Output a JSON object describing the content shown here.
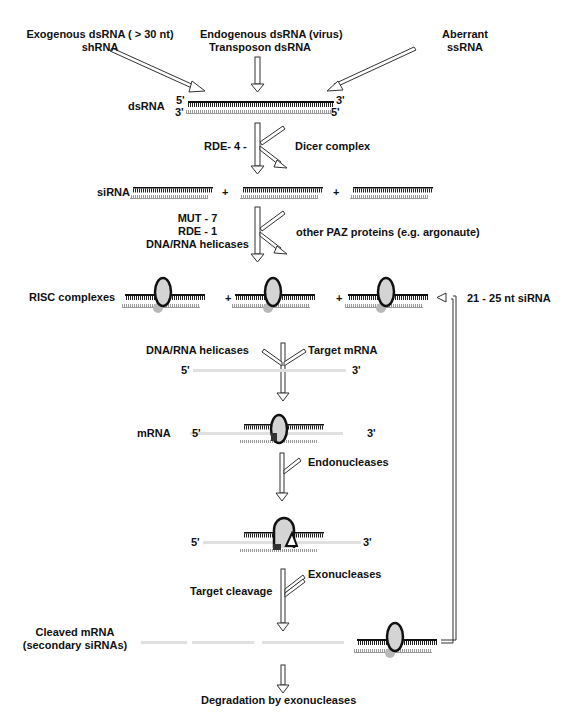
{
  "sources": {
    "left": [
      "Exogenous dsRNA ( > 30 nt)",
      "shRNA"
    ],
    "center": [
      "Endogenous dsRNA (virus)",
      "Transposon dsRNA"
    ],
    "right": [
      "Aberrant",
      "ssRNA"
    ]
  },
  "labels": {
    "dsrna": "dsRNA",
    "sirna": "siRNA",
    "risc": "RISC complexes",
    "mrna": "mRNA",
    "cleaved_1": "Cleaved mRNA",
    "cleaved_2": "(secondary siRNAs)",
    "degradation": "Degradation by exonucleases",
    "feedback": "21 - 25 nt siRNA",
    "plus": "+"
  },
  "steps": {
    "dicer_left": "RDE- 4 -",
    "dicer_right": "Dicer complex",
    "risc_left": [
      "MUT - 7",
      "RDE - 1",
      "DNA/RNA helicases"
    ],
    "risc_right": "other PAZ proteins (e.g. argonaute)",
    "target_left": "DNA/RNA helicases",
    "target_right": "Target mRNA",
    "endo": "Endonucleases",
    "exo": "Exonucleases",
    "cleavage": "Target cleavage"
  },
  "ends": {
    "five": "5'",
    "three": "3'"
  },
  "colors": {
    "strand_dark": "#111111",
    "strand_light": "#9a9a9a",
    "mrna": "#d8d8d8",
    "risc_fill": "#d4d4d4",
    "protein": "#b8b8b8"
  }
}
